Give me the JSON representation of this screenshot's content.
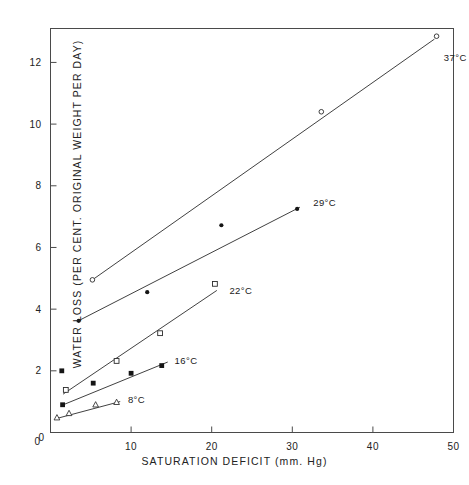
{
  "chart_data": {
    "type": "scatter",
    "title": "",
    "xlabel": "SATURATION  DEFICIT  (mm. Hg)",
    "ylabel": "WATER LOSS (PER CENT. ORIGINAL WEIGHT PER DAY)",
    "xlim": [
      0,
      50
    ],
    "ylim": [
      0,
      13.1
    ],
    "xticks": [
      0,
      10,
      20,
      30,
      40,
      50
    ],
    "xticklabels": [
      "0",
      "10",
      "20",
      "30",
      "40",
      "50"
    ],
    "yticks": [
      0,
      2,
      4,
      6,
      8,
      10,
      12
    ],
    "yticklabels": [
      "0",
      "2",
      "4",
      "6",
      "8",
      "10",
      "12"
    ],
    "grid": false,
    "legend": "inline-end-of-line-annotations",
    "series": [
      {
        "name": "37°C",
        "label": "37°C",
        "marker": "open-circle",
        "label_x": 48.8,
        "label_y": 12.15,
        "points": [
          {
            "x": 5.2,
            "y": 4.95
          },
          {
            "x": 33.6,
            "y": 10.4
          },
          {
            "x": 47.9,
            "y": 12.85
          }
        ],
        "fit_line": [
          {
            "x": 5.2,
            "y": 4.95
          },
          {
            "x": 47.6,
            "y": 12.75
          }
        ]
      },
      {
        "name": "29°C",
        "label": "29°C",
        "marker": "filled-circle",
        "label_x": 32.6,
        "label_y": 7.45,
        "points": [
          {
            "x": 3.5,
            "y": 3.62
          },
          {
            "x": 12.0,
            "y": 4.55
          },
          {
            "x": 21.2,
            "y": 6.72
          },
          {
            "x": 30.6,
            "y": 7.25
          }
        ],
        "fit_line": [
          {
            "x": 3.3,
            "y": 3.6
          },
          {
            "x": 30.9,
            "y": 7.3
          }
        ]
      },
      {
        "name": "22°C",
        "label": "22°C",
        "marker": "open-square",
        "label_x": 22.2,
        "label_y": 4.62,
        "points": [
          {
            "x": 1.9,
            "y": 1.38
          },
          {
            "x": 8.2,
            "y": 2.32
          },
          {
            "x": 13.6,
            "y": 3.22
          },
          {
            "x": 20.4,
            "y": 4.82
          }
        ],
        "fit_line": [
          {
            "x": 1.6,
            "y": 1.25
          },
          {
            "x": 20.6,
            "y": 4.6
          }
        ]
      },
      {
        "name": "16°C",
        "label": "16°C",
        "marker": "filled-square",
        "label_x": 15.4,
        "label_y": 2.35,
        "points": [
          {
            "x": 1.4,
            "y": 2.0
          },
          {
            "x": 1.5,
            "y": 0.9
          },
          {
            "x": 5.3,
            "y": 1.6
          },
          {
            "x": 10.0,
            "y": 1.92
          },
          {
            "x": 13.8,
            "y": 2.17
          }
        ],
        "fit_line": [
          {
            "x": 1.4,
            "y": 0.88
          },
          {
            "x": 14.5,
            "y": 2.28
          }
        ]
      },
      {
        "name": "8°C",
        "label": "8°C",
        "marker": "open-triangle",
        "label_x": 9.6,
        "label_y": 1.08,
        "points": [
          {
            "x": 0.8,
            "y": 0.48
          },
          {
            "x": 2.3,
            "y": 0.62
          },
          {
            "x": 5.6,
            "y": 0.9
          },
          {
            "x": 8.2,
            "y": 0.98
          }
        ],
        "fit_line": [
          {
            "x": 0.7,
            "y": 0.45
          },
          {
            "x": 8.6,
            "y": 1.0
          }
        ]
      }
    ]
  },
  "axes": {
    "x_title": "SATURATION  DEFICIT  (mm. Hg)",
    "y_title": "WATER LOSS (PER CENT. ORIGINAL WEIGHT PER DAY)"
  },
  "caption": ""
}
